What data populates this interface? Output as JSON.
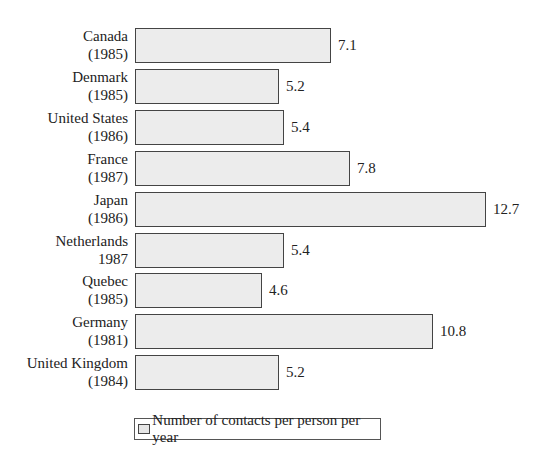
{
  "chart_data": {
    "type": "bar",
    "orientation": "horizontal",
    "title": "",
    "xlabel": "",
    "ylabel": "",
    "categories": [
      [
        "Canada",
        "(1985)"
      ],
      [
        "Denmark",
        "(1985)"
      ],
      [
        "United States",
        "(1986)"
      ],
      [
        "France",
        "(1987)"
      ],
      [
        "Japan",
        "(1986)"
      ],
      [
        "Netherlands",
        "1987"
      ],
      [
        "Quebec",
        "(1985)"
      ],
      [
        "Germany",
        "(1981)"
      ],
      [
        "United Kingdom",
        "(1984)"
      ]
    ],
    "series": [
      {
        "name": "Number of contacts per person per year",
        "values": [
          7.1,
          5.2,
          5.4,
          7.8,
          12.7,
          5.4,
          4.6,
          10.8,
          5.2
        ],
        "value_labels": [
          "7.1",
          "5.2",
          "5.4",
          "7.8",
          "12.7",
          "5.4",
          "4.6",
          "10.8",
          "5.2"
        ],
        "color": "#ececec"
      }
    ],
    "xlim": [
      0,
      12.7
    ],
    "grid": false,
    "axes_visible": false,
    "data_labels": true,
    "legend": {
      "position": "bottom",
      "entries": [
        "Number of contacts per person per year"
      ]
    }
  },
  "layout": {
    "bar_left_px": 135,
    "px_per_unit": 27.6,
    "first_row_top_px": 28,
    "row_pitch_px": 40.9,
    "bar_height_px": 35
  }
}
